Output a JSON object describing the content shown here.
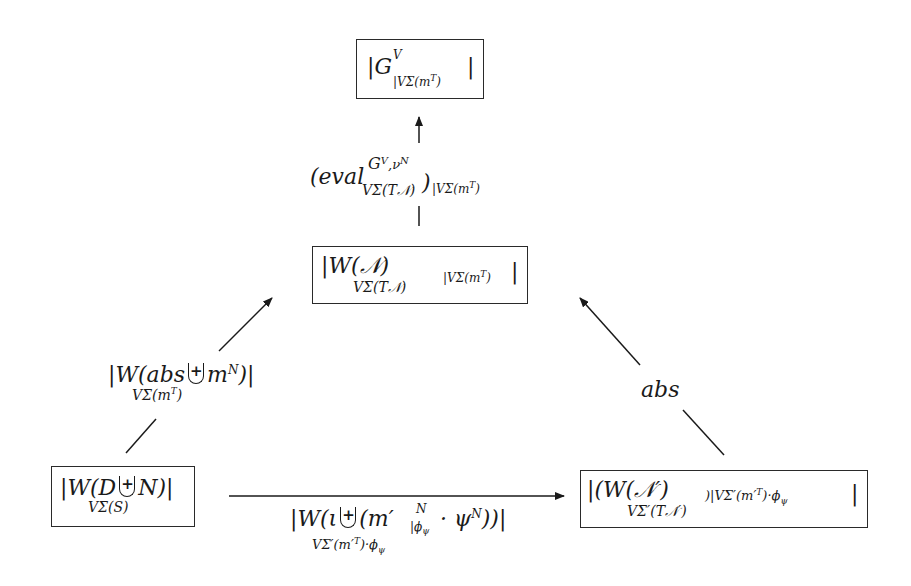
{
  "diagram": {
    "type": "commutative-diagram",
    "nodes": {
      "top": {
        "main": "|G",
        "sup": "V",
        "sub": "|VΣ(m",
        "sub_sup": "T",
        "sub_tail": ")",
        "close": "|"
      },
      "middle": {
        "main": "|W(𝒩)",
        "sub": "VΣ(T𝒩)",
        "restrict": "|VΣ(m",
        "restrict_sup": "T",
        "restrict_tail": ")",
        "close": "|"
      },
      "bottom_left": {
        "main_a": "|W(D",
        "main_b": "N)|",
        "sub": "VΣ(S)",
        "operator": "+"
      },
      "bottom_right": {
        "main": "|(W(𝒩′)",
        "sub": "VΣ′(T𝒩′)",
        "restrict": ")|VΣ′(m′",
        "restrict_sup": "T",
        "restrict_tail": ")·ϕ",
        "restrict_sub": "ψ",
        "close": "|"
      }
    },
    "edges": {
      "eval": {
        "label_a": "(eval",
        "label_sup": "G",
        "label_sup_sup": "V",
        "label_sup_b": ",ν",
        "label_sup_b_sup": "N",
        "label_sub": "VΣ(T𝒩)",
        "label_b": ")",
        "label_restrict": "|VΣ(m",
        "label_restrict_sup": "T",
        "label_restrict_tail": ")",
        "from": "middle",
        "to": "top"
      },
      "left": {
        "label_a": "|W(abs",
        "label_b": "m",
        "label_b_sup": "N",
        "label_c": ")|",
        "label_sub": "VΣ(m",
        "label_sub_sup": "T",
        "label_sub_tail": ")",
        "operator": "+",
        "from": "bottom_left",
        "to": "middle"
      },
      "right": {
        "label": "abs",
        "from": "bottom_right",
        "to": "middle"
      },
      "bottom": {
        "label_a": "|W(ι",
        "label_b": "(m′",
        "label_b_sup": "N",
        "label_b_sub": "|ϕ",
        "label_b_sub_sub": "ψ",
        "label_c": " · ψ",
        "label_c_sup": "N",
        "label_d": "))|",
        "label_sub": "VΣ′(m′",
        "label_sub_sup": "T",
        "label_sub_tail": ")·ϕ",
        "label_sub_sub": "ψ",
        "operator": "+",
        "from": "bottom_left",
        "to": "bottom_right"
      }
    }
  }
}
